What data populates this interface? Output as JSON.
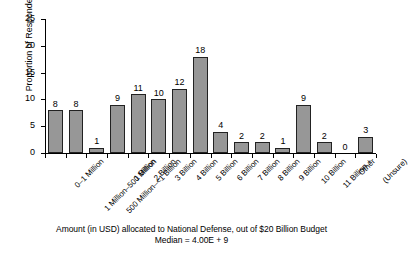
{
  "chart_data": {
    "type": "bar",
    "title": "",
    "xlabel": "Amount (in USD) allocated to National Defense, out of $20 Billion Budget",
    "ylabel": "Proportion of Respondents",
    "ylim": [
      0,
      25
    ],
    "yticks": [
      0,
      5,
      10,
      15,
      20,
      25
    ],
    "grid": false,
    "legend": "none",
    "bar_color": "#979797",
    "bar_edge_color": "#222222",
    "categories": [
      "0–1 Million",
      "1 Million–500 Million",
      "500 Million–<1 Billion",
      "1 Billion",
      "2 Billion",
      "3 Billion",
      "4 Billion",
      "5 Billion",
      "6 Billion",
      "7 Billion",
      "8 Billion",
      "9 Billion",
      "10 Billion",
      "11 Billion +",
      "Other",
      "(Unsure)"
    ],
    "values": [
      8,
      8,
      1,
      9,
      11,
      10,
      12,
      18,
      4,
      2,
      2,
      1,
      9,
      2,
      0,
      3
    ],
    "annotations": [
      "Median = 4.00E + 9"
    ]
  },
  "caption": {
    "line1": "Amount (in USD) allocated to National Defense, out of $20 Billion Budget",
    "line2": "Median = 4.00E + 9"
  }
}
